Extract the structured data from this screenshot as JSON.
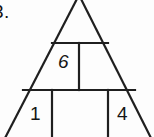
{
  "figure": {
    "problem_number": "3.",
    "background_color": "#fdfdfd",
    "stroke_color": "#1f1f1f",
    "shape": "triangle-divided-into-cells",
    "cells": [
      {
        "name": "upper-left-cell",
        "value": "6"
      },
      {
        "name": "upper-right-cell",
        "value": ""
      },
      {
        "name": "lower-left-cell",
        "value": "1"
      },
      {
        "name": "lower-middle-cell",
        "value": ""
      },
      {
        "name": "lower-right-cell",
        "value": "4"
      }
    ],
    "values": {
      "top": "6",
      "left": "1",
      "right": "4"
    },
    "geometry": {
      "apex": [
        79,
        -5
      ],
      "upper_divider_y": 43,
      "upper_divider_x1": 52,
      "upper_divider_x2": 108,
      "lower_divider_y": 90,
      "lower_divider_x1": 23,
      "lower_divider_x2": 135,
      "middle_vertical_x": 79,
      "lower_vertical_left_x": 52,
      "lower_vertical_right_x": 108,
      "left_base_x": 4,
      "right_base_x": 152,
      "base_y": 137
    }
  }
}
